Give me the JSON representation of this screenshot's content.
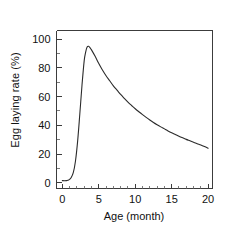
{
  "chart_data": {
    "type": "line",
    "title": "",
    "xlabel": "Age (month)",
    "ylabel": "Egg laying rate (%)",
    "xlim": [
      -0.8,
      20.6
    ],
    "ylim": [
      -4,
      106
    ],
    "xticks": [
      0,
      5,
      10,
      15,
      20
    ],
    "xtick_labels": [
      "0",
      "5",
      "10",
      "15",
      "20"
    ],
    "xminor_interval": 1,
    "yticks": [
      0,
      20,
      40,
      60,
      80,
      100
    ],
    "ytick_labels": [
      "0",
      "20",
      "40",
      "60",
      "80",
      "100"
    ],
    "yminor_interval": 10,
    "grid": false,
    "legend": null,
    "series": [
      {
        "name": "Egg laying rate",
        "color": "#2b2b2b",
        "x": [
          0.0,
          0.3,
          0.6,
          0.9,
          1.2,
          1.5,
          1.8,
          2.1,
          2.4,
          2.7,
          3.0,
          3.2,
          3.4,
          3.6,
          3.8,
          4.0,
          4.5,
          5.0,
          5.5,
          6.0,
          6.5,
          7.0,
          7.5,
          8.0,
          8.5,
          9.0,
          9.5,
          10.0,
          10.5,
          11.0,
          11.5,
          12.0,
          12.5,
          13.0,
          13.5,
          14.0,
          14.5,
          15.0,
          15.5,
          16.0,
          16.5,
          17.0,
          17.5,
          18.0,
          18.5,
          19.0,
          19.5,
          20.0
        ],
        "y": [
          1.5,
          1.4,
          1.5,
          2.0,
          3.5,
          7.0,
          15.0,
          29.0,
          48.0,
          68.0,
          85.0,
          91.0,
          94.5,
          95.0,
          94.0,
          92.5,
          88.0,
          83.0,
          78.5,
          74.5,
          71.0,
          67.5,
          64.5,
          61.5,
          58.8,
          56.2,
          53.8,
          51.5,
          49.4,
          47.4,
          45.5,
          43.7,
          42.0,
          40.4,
          38.9,
          37.5,
          36.1,
          34.8,
          33.6,
          32.4,
          31.3,
          30.2,
          29.2,
          28.2,
          27.2,
          26.3,
          25.2,
          24.0
        ]
      }
    ],
    "peak": {
      "x": 3.5,
      "y": 95
    },
    "start_value": 1.5,
    "end_value": 24.0
  },
  "style": {
    "axis_color": "#3c3c3c",
    "text_color": "#111111",
    "background": "#ffffff",
    "line_color": "#2b2b2b"
  }
}
